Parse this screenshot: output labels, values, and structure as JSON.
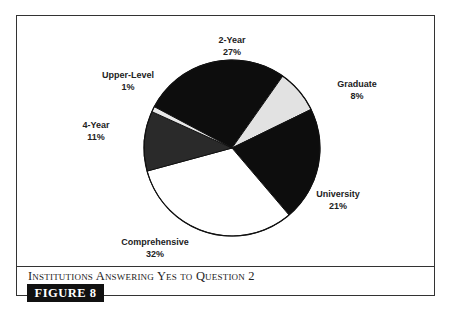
{
  "chart_data": {
    "type": "pie",
    "title": "Institutions Answering Yes to Question 2",
    "figure_label": "FIGURE 8",
    "start_angle_deg": -62,
    "center": [
      232,
      148
    ],
    "radius": 88,
    "slices": [
      {
        "label": "2-Year",
        "value": 27,
        "display": "27%",
        "color": "#0d0d0d",
        "label_pos": [
          232,
          34
        ]
      },
      {
        "label": "Graduate",
        "value": 8,
        "display": "8%",
        "color": "#e2e2e2",
        "label_pos": [
          357,
          78
        ]
      },
      {
        "label": "University",
        "value": 21,
        "display": "21%",
        "color": "#0d0d0d",
        "label_pos": [
          338,
          188
        ]
      },
      {
        "label": "Comprehensive",
        "value": 32,
        "display": "32%",
        "color": "#ffffff",
        "label_pos": [
          155,
          236
        ]
      },
      {
        "label": "4-Year",
        "value": 11,
        "display": "11%",
        "color": "#2a2a2a",
        "label_pos": [
          96,
          119
        ]
      },
      {
        "label": "Upper-Level",
        "value": 1,
        "display": "1%",
        "color": "#e8e8e8",
        "label_pos": [
          128,
          69
        ]
      }
    ]
  },
  "caption": "Institutions Answering Yes to Question 2",
  "badge": "FIGURE 8"
}
